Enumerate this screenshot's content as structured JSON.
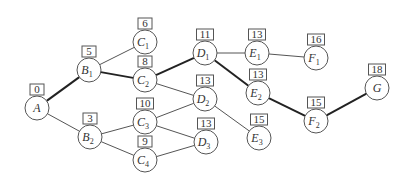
{
  "diagram": {
    "type": "network-graph",
    "nodes": [
      {
        "id": "A",
        "letter": "A",
        "sub": "",
        "label": "0",
        "x": 37,
        "y": 108
      },
      {
        "id": "B1",
        "letter": "B",
        "sub": "1",
        "label": "5",
        "x": 89,
        "y": 70
      },
      {
        "id": "B2",
        "letter": "B",
        "sub": "2",
        "label": "3",
        "x": 90,
        "y": 137
      },
      {
        "id": "C1",
        "letter": "C",
        "sub": "1",
        "label": "6",
        "x": 145,
        "y": 42
      },
      {
        "id": "C2",
        "letter": "C",
        "sub": "2",
        "label": "8",
        "x": 145,
        "y": 80
      },
      {
        "id": "C3",
        "letter": "C",
        "sub": "3",
        "label": "10",
        "x": 145,
        "y": 122
      },
      {
        "id": "C4",
        "letter": "C",
        "sub": "4",
        "label": "9",
        "x": 145,
        "y": 160
      },
      {
        "id": "D1",
        "letter": "D",
        "sub": "1",
        "label": "11",
        "x": 205,
        "y": 53
      },
      {
        "id": "D2",
        "letter": "D",
        "sub": "2",
        "label": "13",
        "x": 205,
        "y": 99
      },
      {
        "id": "D3",
        "letter": "D",
        "sub": "3",
        "label": "13",
        "x": 206,
        "y": 142
      },
      {
        "id": "E1",
        "letter": "E",
        "sub": "1",
        "label": "13",
        "x": 257,
        "y": 53
      },
      {
        "id": "E2",
        "letter": "E",
        "sub": "2",
        "label": "13",
        "x": 258,
        "y": 93
      },
      {
        "id": "E3",
        "letter": "E",
        "sub": "3",
        "label": "15",
        "x": 259,
        "y": 138
      },
      {
        "id": "F1",
        "letter": "F",
        "sub": "1",
        "label": "16",
        "x": 316,
        "y": 58
      },
      {
        "id": "F2",
        "letter": "F",
        "sub": "2",
        "label": "15",
        "x": 316,
        "y": 121
      },
      {
        "id": "G",
        "letter": "G",
        "sub": "",
        "label": "18",
        "x": 377,
        "y": 88
      }
    ],
    "edges": [
      {
        "from": "A",
        "to": "B1",
        "critical": true
      },
      {
        "from": "A",
        "to": "B2",
        "critical": false
      },
      {
        "from": "B1",
        "to": "C1",
        "critical": false
      },
      {
        "from": "B1",
        "to": "C2",
        "critical": true
      },
      {
        "from": "B2",
        "to": "C3",
        "critical": false
      },
      {
        "from": "B2",
        "to": "C4",
        "critical": false
      },
      {
        "from": "C2",
        "to": "D1",
        "critical": true
      },
      {
        "from": "C2",
        "to": "D2",
        "critical": false
      },
      {
        "from": "C3",
        "to": "D2",
        "critical": false
      },
      {
        "from": "C3",
        "to": "D3",
        "critical": false
      },
      {
        "from": "C4",
        "to": "D3",
        "critical": false
      },
      {
        "from": "D1",
        "to": "E1",
        "critical": false
      },
      {
        "from": "D1",
        "to": "E2",
        "critical": true
      },
      {
        "from": "D2",
        "to": "E3",
        "critical": false
      },
      {
        "from": "E1",
        "to": "F1",
        "critical": false
      },
      {
        "from": "E2",
        "to": "F2",
        "critical": true
      },
      {
        "from": "F2",
        "to": "G",
        "critical": true
      }
    ]
  }
}
